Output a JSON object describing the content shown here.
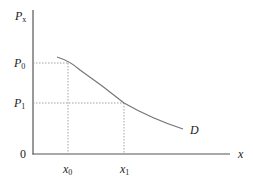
{
  "diagram": {
    "title": "",
    "type": "demand-curve",
    "y_axis": {
      "label": "P",
      "label_sub": "x",
      "ticks": [
        {
          "label": "P",
          "sub": "0",
          "level": "P0"
        },
        {
          "label": "P",
          "sub": "1",
          "level": "P1"
        }
      ],
      "origin_label": "0"
    },
    "x_axis": {
      "label": "x",
      "ticks": [
        {
          "label": "x",
          "sub": "0"
        },
        {
          "label": "x",
          "sub": "1"
        }
      ]
    },
    "curve": {
      "label": "D",
      "description": "Downward-sloping demand curve"
    },
    "guides": [
      {
        "from": "P0",
        "to": "x0",
        "style": "dotted"
      },
      {
        "from": "P1",
        "to": "x1",
        "style": "dotted"
      }
    ],
    "colors": {
      "axis": "#555555",
      "curve": "#777777",
      "guide": "#999999",
      "text": "#222222"
    }
  }
}
